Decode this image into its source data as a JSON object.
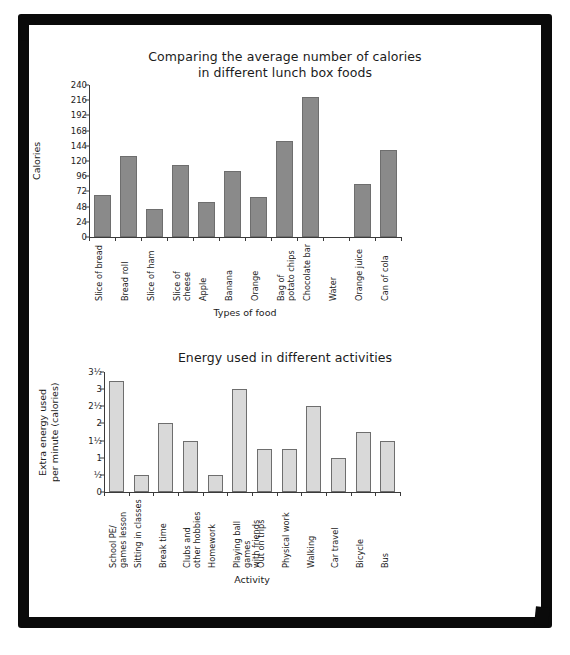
{
  "page": {
    "frame_color": "#0a0a0a",
    "background": "#ffffff"
  },
  "chart_data": [
    {
      "type": "bar",
      "id": "lunch-box-calories",
      "title_line1": "Comparing the average number of calories",
      "title_line2": "in different lunch box foods",
      "title": "Comparing the average number of calories in different lunch box foods",
      "xlabel": "Types of food",
      "ylabel": "Calories",
      "ylim": [
        0,
        240
      ],
      "ytick_step": 24,
      "ytick_labels": [
        "0",
        "24",
        "48",
        "72",
        "96",
        "120",
        "144",
        "168",
        "192",
        "216",
        "240"
      ],
      "ytick_values": [
        0,
        24,
        48,
        72,
        96,
        120,
        144,
        168,
        192,
        216,
        240
      ],
      "grid": false,
      "legend": "none",
      "bar_color": "#8a8a8a",
      "bar_border": "#6e6e6e",
      "categories": [
        "Slice of bread",
        "Bread roll",
        "Slice of ham",
        "Slice of cheese",
        "Apple",
        "Banana",
        "Orange",
        "Bag of\npotato chips",
        "Chocolate bar",
        "Water",
        "Orange juice",
        "Can of cola"
      ],
      "values": [
        66,
        128,
        45,
        113,
        55,
        105,
        63,
        151,
        221,
        0,
        84,
        138
      ]
    },
    {
      "type": "bar",
      "id": "energy-used-activities",
      "title_line1": "Energy used in different activities",
      "title_line2": "",
      "title": "Energy used in different activities",
      "xlabel": "Activity",
      "ylabel": "Extra energy used\nper minute (calories)",
      "ylim": [
        0,
        3.5
      ],
      "ytick_step": 0.5,
      "ytick_labels": [
        "0",
        "½",
        "1",
        "1½",
        "2",
        "2½",
        "3",
        "3½"
      ],
      "ytick_values": [
        0,
        0.5,
        1,
        1.5,
        2,
        2.5,
        3,
        3.5
      ],
      "grid": false,
      "legend": "none",
      "bar_color": "#d9d9d9",
      "bar_border": "#6e6e6e",
      "categories": [
        "School PE/\ngames lesson",
        "Sitting in classes",
        "Break time",
        "Clubs and\nother hobbies",
        "Homework",
        "Playing ball games\nwith friends",
        "Out on trips",
        "Physical work",
        "Walking",
        "Car travel",
        "Bicycle",
        "Bus"
      ],
      "values": [
        3.25,
        0.5,
        2,
        1.5,
        0.5,
        3,
        1.25,
        1.25,
        2.5,
        1,
        1.75,
        1.5
      ]
    }
  ]
}
